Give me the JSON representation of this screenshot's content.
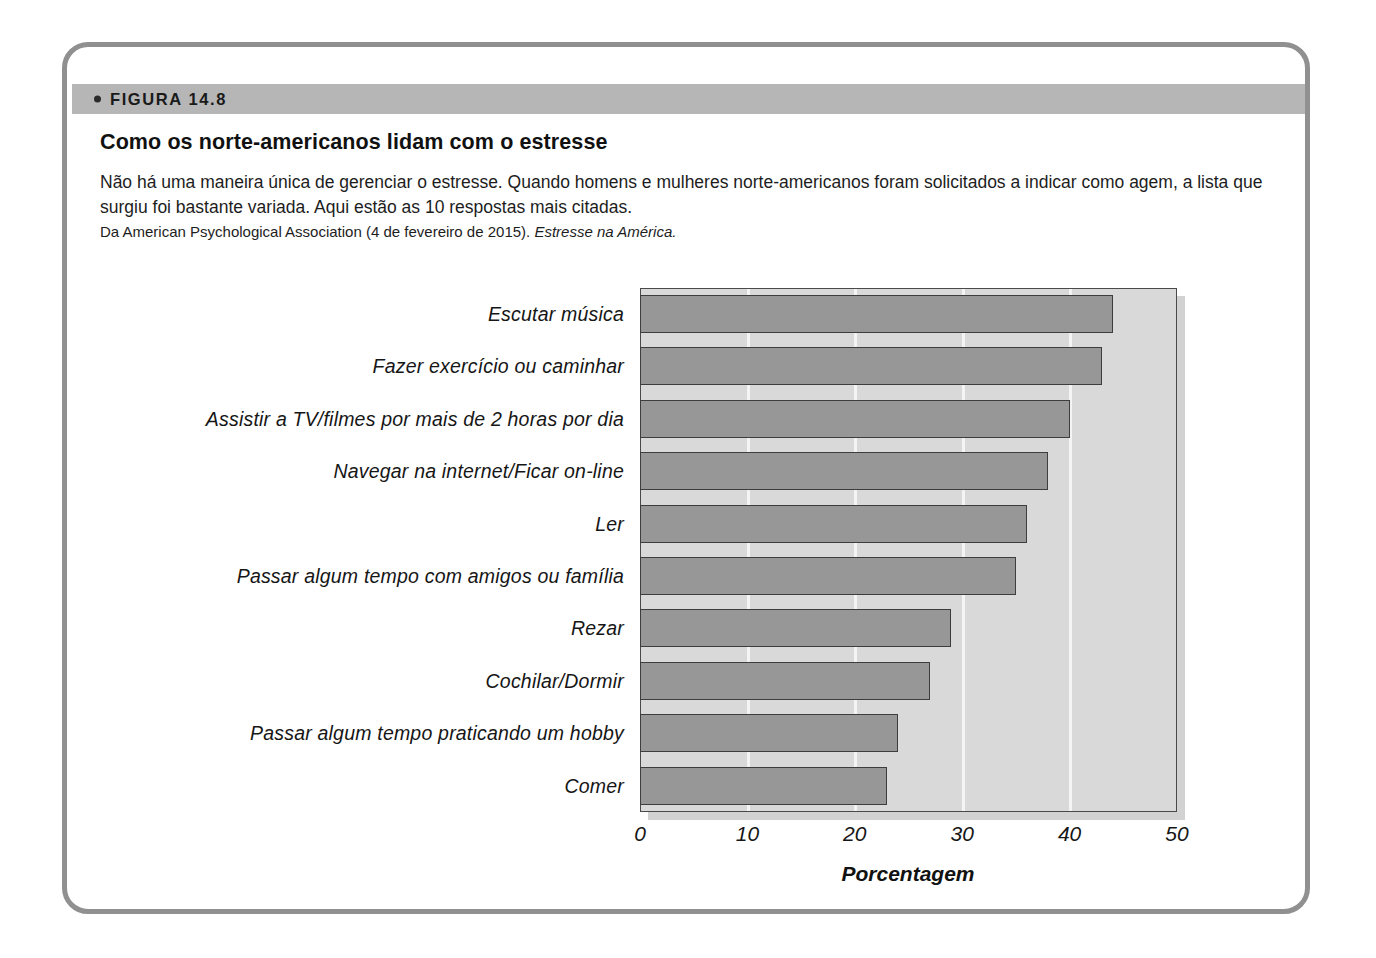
{
  "figure": {
    "band_label": "FIGURA 14.8",
    "bullet_icon": "bullet-dot-icon",
    "title": "Como os norte-americanos lidam com o estresse",
    "description": "Não há uma maneira única de gerenciar o estresse. Quando homens e mulheres norte-americanos foram solicitados a indicar como agem, a lista que surgiu foi bastante variada. Aqui estão as 10 respostas mais citadas.",
    "source_prefix": "Da American Psychological Association (4 de fevereiro de 2015). ",
    "source_italic": "Estresse na América."
  },
  "colors": {
    "frame_border": "#909090",
    "band_background": "#b6b6b6",
    "plot_background": "#d9d9d9",
    "bar_fill": "#979797",
    "bar_outline": "#3d3d3d",
    "gridline": "#f4f4f4",
    "text": "#161616"
  },
  "chart_data": {
    "type": "bar",
    "orientation": "horizontal",
    "title": "Como os norte-americanos lidam com o estresse",
    "xlabel": "Porcentagem",
    "ylabel": "",
    "xlim": [
      0,
      50
    ],
    "xticks": [
      0,
      10,
      20,
      30,
      40,
      50
    ],
    "xtick_labels": [
      "0",
      "10",
      "20",
      "30",
      "40",
      "50"
    ],
    "grid": true,
    "legend": null,
    "categories": [
      "Escutar música",
      "Fazer exercício ou caminhar",
      "Assistir a TV/filmes por mais de 2 horas por dia",
      "Navegar na internet/Ficar on-line",
      "Ler",
      "Passar algum tempo com amigos ou família",
      "Rezar",
      "Cochilar/Dormir",
      "Passar algum tempo praticando um hobby",
      "Comer"
    ],
    "values": [
      44,
      43,
      40,
      38,
      36,
      35,
      29,
      27,
      24,
      23
    ]
  }
}
